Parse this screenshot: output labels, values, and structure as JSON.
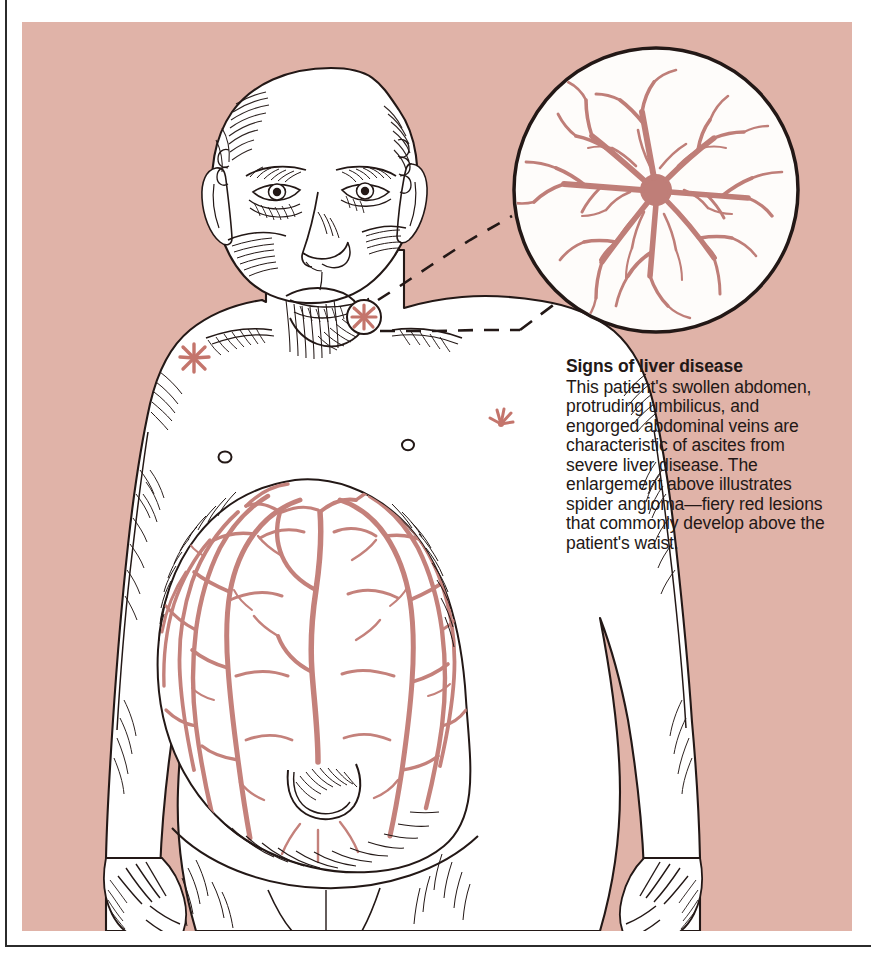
{
  "figure": {
    "name": "signs-of-liver-disease-illustration",
    "medium": "pen-and-ink medical illustration with flat color panel",
    "panel_background_color": "#e0b3a8",
    "skin_color": "#ffffff",
    "ink_color": "#231816",
    "vessel_color": "#c4817b",
    "lesion_color": "#c4756c"
  },
  "caption": {
    "title": "Signs of liver disease",
    "body": "This patient's swollen abdomen, protruding umbilicus, and engorged abdominal veins are characteristic of ascites from severe liver disease. The enlargement above illustrates spider angioma—fiery red lesions that commonly develop above the patient's waist.",
    "text_color": "#231816"
  },
  "subject": {
    "label": "bald male patient, front view, torso and head",
    "parts": [
      {
        "name": "head",
        "label": "bald head with hatched shading"
      },
      {
        "name": "face",
        "label": "face with eyes, nose, mouth and jowls"
      },
      {
        "name": "neck",
        "label": "neck with vertical hatching"
      },
      {
        "name": "left-nipple",
        "label": "nipple"
      },
      {
        "name": "right-nipple",
        "label": "nipple"
      },
      {
        "name": "abdomen",
        "label": "grossly distended abdomen from ascites"
      },
      {
        "name": "umbilicus",
        "label": "protruding umbilicus"
      },
      {
        "name": "left-arm",
        "label": "left arm hanging at side"
      },
      {
        "name": "right-arm",
        "label": "right arm hanging at side"
      },
      {
        "name": "left-hand",
        "label": "left hand with fingers"
      },
      {
        "name": "right-hand",
        "label": "right hand with fingers"
      },
      {
        "name": "thighs",
        "label": "upper thighs"
      }
    ]
  },
  "findings": {
    "caput_medusae": {
      "label": "engorged abdominal veins (caput medusae)",
      "color": "#c4817b",
      "description": "branching network of dilated superficial veins radiating over the distended abdomen"
    },
    "spider_angiomas": [
      {
        "name": "spider-angioma-neck",
        "label": "spider angioma at base of neck",
        "circled": true,
        "x": 364,
        "y": 317,
        "size": 26
      },
      {
        "name": "spider-angioma-chest",
        "label": "spider angioma on upper chest",
        "circled": false,
        "x": 194,
        "y": 358,
        "size": 28
      },
      {
        "name": "spider-angioma-arm",
        "label": "spider angioma on right upper arm",
        "circled": false,
        "x": 501,
        "y": 418,
        "size": 24
      }
    ]
  },
  "enlargement": {
    "name": "spider-angioma-enlargement",
    "label": "circular magnified inset of a spider angioma",
    "center_x": 656,
    "center_y": 190,
    "radius": 144,
    "fill": "#fefcfa",
    "stroke": "#231816",
    "vessel_color": "#bf7e78",
    "leader_line": {
      "name": "leader-line",
      "style": "dashed",
      "from_x": 378,
      "from_y": 330,
      "to_x": 530,
      "to_y": 262
    }
  }
}
